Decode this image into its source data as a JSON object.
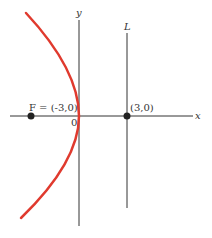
{
  "diagram": {
    "type": "parabola",
    "equation": "y^2 = -12x",
    "axes": {
      "x_label": "x",
      "y_label": "y",
      "origin_label": "0"
    },
    "focus": {
      "label": "F = (-3,0)",
      "x": -3,
      "y": 0
    },
    "directrix": {
      "label": "L",
      "x": 3
    },
    "directrix_point": {
      "label": "(3,0)",
      "x": 3,
      "y": 0
    },
    "colors": {
      "curve": "#e03a2e",
      "axes": "#333333",
      "points": "#222222"
    }
  }
}
